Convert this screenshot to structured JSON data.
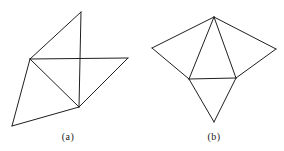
{
  "style": {
    "line_color": "#1f1f1f",
    "background": "#ffffff",
    "line_width": 1
  },
  "figures": [
    {
      "id": "a",
      "label": "(a)",
      "label_pos": [
        68,
        136
      ],
      "vertices": {
        "top": [
          81,
          12
        ],
        "left_mid": [
          30,
          59
        ],
        "right": [
          128,
          58
        ],
        "bottom_mid": [
          79,
          107
        ],
        "bottom_left": [
          12,
          126
        ]
      },
      "edges": [
        [
          "top",
          "left_mid"
        ],
        [
          "top",
          "bottom_mid"
        ],
        [
          "left_mid",
          "right"
        ],
        [
          "right",
          "bottom_mid"
        ],
        [
          "left_mid",
          "bottom_mid"
        ],
        [
          "left_mid",
          "bottom_left"
        ],
        [
          "bottom_left",
          "bottom_mid"
        ]
      ]
    },
    {
      "id": "b",
      "label": "(b)",
      "label_pos": [
        214,
        136
      ],
      "vertices": {
        "top": [
          214,
          17
        ],
        "left": [
          152,
          48
        ],
        "right": [
          276,
          49
        ],
        "mid_left": [
          189,
          79
        ],
        "mid_right": [
          236,
          78
        ],
        "bottom": [
          214,
          122
        ]
      },
      "edges": [
        [
          "top",
          "left"
        ],
        [
          "top",
          "right"
        ],
        [
          "left",
          "mid_left"
        ],
        [
          "right",
          "mid_right"
        ],
        [
          "top",
          "mid_left"
        ],
        [
          "top",
          "mid_right"
        ],
        [
          "mid_left",
          "mid_right"
        ],
        [
          "mid_left",
          "bottom"
        ],
        [
          "mid_right",
          "bottom"
        ]
      ]
    }
  ]
}
